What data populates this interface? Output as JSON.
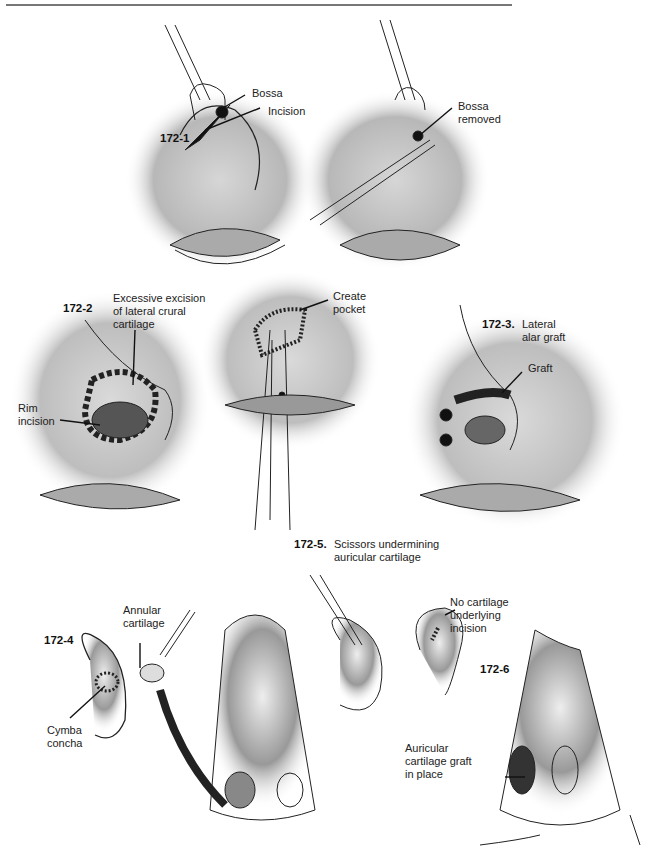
{
  "header": {
    "page_marker": ""
  },
  "figures": [
    {
      "id": "172-1",
      "labels": [
        "Bossa",
        "Incision"
      ]
    },
    {
      "id": "172-1b",
      "labels": [
        "Bossa\nremoved"
      ]
    },
    {
      "id": "172-2",
      "labels": [
        "Excessive excision\nof lateral crural\ncartilage",
        "Rim\nincision"
      ]
    },
    {
      "id": "center",
      "labels": [
        "Create\npocket"
      ]
    },
    {
      "id": "172-3.",
      "caption": "Lateral\nalar graft",
      "labels": [
        "Graft"
      ]
    },
    {
      "id": "172-5.",
      "caption": "Scissors undermining\nauricular cartilage"
    },
    {
      "id": "172-4",
      "labels": [
        "Annular\ncartilage",
        "Cymba\nconcha"
      ]
    },
    {
      "id": "ear2",
      "labels": [
        "No cartilage\nunderlying\nincision"
      ]
    },
    {
      "id": "172-6",
      "labels": [
        "Auricular\ncartilage graft\nin place"
      ]
    }
  ]
}
